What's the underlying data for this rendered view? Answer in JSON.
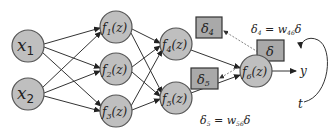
{
  "diagram": {
    "inputs": [
      {
        "id": "x1",
        "label": "x",
        "sub": "1"
      },
      {
        "id": "x2",
        "label": "x",
        "sub": "2"
      }
    ],
    "hidden1": [
      {
        "id": "f1",
        "label": "f",
        "sub": "1",
        "arg": "(z)"
      },
      {
        "id": "f2",
        "label": "f",
        "sub": "2",
        "arg": "(z)"
      },
      {
        "id": "f3",
        "label": "f",
        "sub": "3",
        "arg": "(z)"
      }
    ],
    "hidden2": [
      {
        "id": "f4",
        "label": "f",
        "sub": "4",
        "arg": "(z)"
      },
      {
        "id": "f5",
        "label": "f",
        "sub": "5",
        "arg": "(z)"
      }
    ],
    "output": {
      "id": "f6",
      "label": "f",
      "sub": "6",
      "arg": "(z)"
    },
    "deltas": {
      "d4": {
        "label": "δ",
        "sub": "4"
      },
      "d5": {
        "label": "δ",
        "sub": "5"
      },
      "d": {
        "label": "δ"
      }
    },
    "equations": {
      "eq4": {
        "lhs": "δ",
        "lhs_sub": "4",
        "mid": " = w",
        "w_sub": "46",
        "rhs": "δ"
      },
      "eq5": {
        "lhs": "δ",
        "lhs_sub": "5",
        "mid": " = w",
        "w_sub": "56",
        "rhs": "δ"
      }
    },
    "output_label": "y",
    "target_label": "t"
  }
}
